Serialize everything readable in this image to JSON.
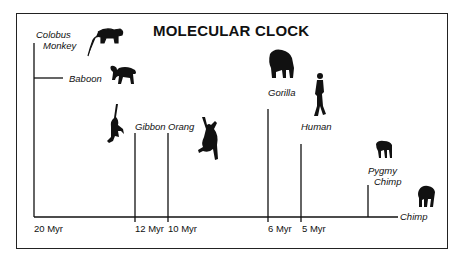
{
  "title": "MOLECULAR CLOCK",
  "species": {
    "colobus": "Colobus Monkey",
    "colobus_line1": "Colobus",
    "colobus_line2": "Monkey",
    "baboon": "Baboon",
    "gibbon": "Gibbon",
    "orang": "Orang",
    "gorilla": "Gorilla",
    "human": "Human",
    "pygmy_line1": "Pygmy",
    "pygmy_line2": "Chimp",
    "chimp": "Chimp"
  },
  "time_axis": {
    "t20": "20 Myr",
    "t12": "12 Myr",
    "t10": "10 Myr",
    "t6": "6 Myr",
    "t5": "5 Myr"
  },
  "divergences": [
    {
      "lineage": "Colobus Monkey / Baboon",
      "time_myr": 20
    },
    {
      "lineage": "Gibbon",
      "time_myr": 12
    },
    {
      "lineage": "Orang",
      "time_myr": 10
    },
    {
      "lineage": "Gorilla",
      "time_myr": 6
    },
    {
      "lineage": "Human",
      "time_myr": 5
    },
    {
      "lineage": "Pygmy Chimp / Chimp",
      "time_myr": null
    }
  ],
  "colors": {
    "ink": "#111111",
    "background": "#ffffff"
  }
}
